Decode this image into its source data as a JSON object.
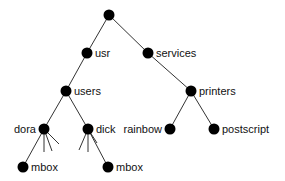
{
  "diagram": {
    "type": "tree",
    "nodes": [
      {
        "id": "root",
        "label": "",
        "x": 109,
        "y": 15
      },
      {
        "id": "usr",
        "label": "usr",
        "x": 87,
        "y": 53,
        "label_side": "right"
      },
      {
        "id": "services",
        "label": "services",
        "x": 148,
        "y": 53,
        "label_side": "right"
      },
      {
        "id": "users",
        "label": "users",
        "x": 66,
        "y": 91,
        "label_side": "right"
      },
      {
        "id": "printers",
        "label": "printers",
        "x": 191,
        "y": 91,
        "label_side": "right"
      },
      {
        "id": "dora",
        "label": "dora",
        "x": 44,
        "y": 129,
        "label_side": "left"
      },
      {
        "id": "dick",
        "label": "dick",
        "x": 88,
        "y": 129,
        "label_side": "right"
      },
      {
        "id": "rainbow",
        "label": "rainbow",
        "x": 170,
        "y": 129,
        "label_side": "left"
      },
      {
        "id": "postscript",
        "label": "postscript",
        "x": 214,
        "y": 129,
        "label_side": "right"
      },
      {
        "id": "dora_mbox",
        "label": "mbox",
        "x": 23,
        "y": 167,
        "label_side": "right"
      },
      {
        "id": "dick_mbox",
        "label": "mbox",
        "x": 108,
        "y": 167,
        "label_side": "right"
      }
    ],
    "edges": [
      [
        "root",
        "usr"
      ],
      [
        "root",
        "services"
      ],
      [
        "usr",
        "users"
      ],
      [
        "services",
        "printers"
      ],
      [
        "users",
        "dora"
      ],
      [
        "users",
        "dick"
      ],
      [
        "printers",
        "rainbow"
      ],
      [
        "printers",
        "postscript"
      ],
      [
        "dora",
        "dora_mbox"
      ],
      [
        "dick",
        "dick_mbox"
      ]
    ],
    "stubs": [
      {
        "from": "dora",
        "to": [
          44,
          152
        ]
      },
      {
        "from": "dora",
        "to": [
          52,
          151
        ]
      },
      {
        "from": "dora",
        "to": [
          59,
          144
        ]
      },
      {
        "from": "dick",
        "to": [
          79,
          150
        ]
      },
      {
        "from": "dick",
        "to": [
          88,
          152
        ]
      },
      {
        "from": "dick",
        "to": [
          97,
          143
        ]
      }
    ]
  }
}
